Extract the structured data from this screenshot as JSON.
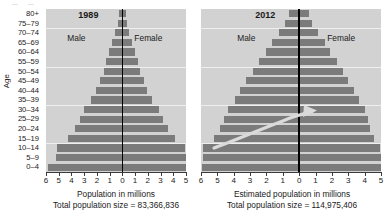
{
  "axis": {
    "y_title": "Age",
    "age_groups": [
      "80+",
      "75–79",
      "70–74",
      "65–69",
      "60–64",
      "55–59",
      "50–54",
      "45–49",
      "40–44",
      "35–39",
      "30–34",
      "25–29",
      "20–24",
      "15–19",
      "10–14",
      "5–9",
      "0–4"
    ],
    "x_ticks_left": [
      "6",
      "5",
      "4",
      "3",
      "2",
      "1",
      "0",
      "1",
      "2",
      "3",
      "4",
      "5"
    ],
    "x_ticks_right": [
      "6",
      "5",
      "4",
      "3",
      "2",
      "1",
      "0",
      "1",
      "2",
      "3",
      "4",
      "5"
    ]
  },
  "panels": [
    {
      "id": "panel-1989",
      "year": "1989",
      "male_label": "Male",
      "female_label": "Female",
      "x_axis_label": "Population in millions",
      "total_label": "Total population size = 83,366,836"
    },
    {
      "id": "panel-2012",
      "year": "2012",
      "male_label": "Male",
      "female_label": "Female",
      "x_axis_label": "Estimated population in millions",
      "total_label": "Total population size = 114,975,406"
    }
  ],
  "colors": {
    "plot_background": "#d2d2d2",
    "bar": "#7b7b7b",
    "center_line": "#000000",
    "gridline": "#efefef",
    "arrow": "#d8d8d8"
  },
  "chart_data": {
    "type": "bar",
    "title": "",
    "subtitle": "",
    "chart_kind": "population-pyramid",
    "ylabel": "Age",
    "categories": [
      "0–4",
      "5–9",
      "10–14",
      "15–19",
      "20–24",
      "25–29",
      "30–34",
      "35–39",
      "40–44",
      "45–49",
      "50–54",
      "55–59",
      "60–64",
      "65–69",
      "70–74",
      "75–79",
      "80+"
    ],
    "panels": [
      {
        "name": "1989",
        "xlabel": "Population in millions",
        "annotation": "Total population size = 83,366,836",
        "xlim": [
          -6,
          5
        ],
        "series": [
          {
            "name": "Male",
            "side": "left",
            "values": [
              5.85,
              5.25,
              5.15,
              4.25,
              3.75,
              3.35,
              3.05,
              2.45,
              2.05,
              1.75,
              1.45,
              1.25,
              1.05,
              0.8,
              0.55,
              0.35,
              0.28
            ]
          },
          {
            "name": "Female",
            "side": "right",
            "values": [
              5.6,
              5.05,
              4.95,
              4.1,
              3.6,
              3.2,
              2.9,
              2.35,
              1.95,
              1.7,
              1.4,
              1.2,
              1.0,
              0.78,
              0.52,
              0.34,
              0.27
            ]
          }
        ]
      },
      {
        "name": "2012",
        "xlabel": "Estimated population in millions",
        "annotation": "Total population size = 114,975,406",
        "xlim": [
          -6,
          5
        ],
        "series": [
          {
            "name": "Male",
            "side": "left",
            "values": [
              5.95,
              5.9,
              5.85,
              5.2,
              4.85,
              4.6,
              4.35,
              3.95,
              3.6,
              3.25,
              2.85,
              2.45,
              2.05,
              1.65,
              1.25,
              0.85,
              0.6
            ]
          },
          {
            "name": "Female",
            "side": "right",
            "values": [
              5.05,
              5.0,
              4.95,
              4.55,
              4.35,
              4.2,
              4.0,
              3.65,
              3.35,
              3.0,
              2.65,
              2.3,
              1.9,
              1.55,
              1.15,
              0.8,
              0.58
            ]
          }
        ]
      }
    ],
    "legend": [
      "Male",
      "Female"
    ],
    "grid": true
  }
}
